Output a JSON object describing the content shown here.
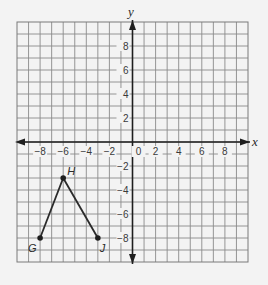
{
  "chart_data": {
    "type": "scatter",
    "title": "",
    "xlabel": "x",
    "ylabel": "y",
    "xlim": [
      -10,
      10
    ],
    "ylim": [
      -10,
      10
    ],
    "grid": true,
    "grid_step": 1,
    "x_ticks": [
      -8,
      -6,
      -4,
      -2,
      0,
      2,
      4,
      6,
      8
    ],
    "y_ticks": [
      8,
      6,
      4,
      2,
      -2,
      -4,
      -6,
      -8
    ],
    "x_tick_labels": [
      "−8",
      "−6",
      "−4",
      "−2",
      "0",
      "2",
      "4",
      "6",
      "8"
    ],
    "y_tick_labels": [
      "8",
      "6",
      "4",
      "2",
      "−2",
      "−4",
      "−6",
      "−8"
    ],
    "points": [
      {
        "label": "G",
        "x": -8,
        "y": -8
      },
      {
        "label": "H",
        "x": -6,
        "y": -3
      },
      {
        "label": "J",
        "x": -3,
        "y": -8
      }
    ],
    "segments": [
      {
        "from": "G",
        "to": "H"
      },
      {
        "from": "H",
        "to": "J"
      }
    ]
  },
  "colors": {
    "grid": "#8a8a8a",
    "axis": "#1e1e1e",
    "ink": "#2a2a2a",
    "background": "#f3f3f3"
  }
}
